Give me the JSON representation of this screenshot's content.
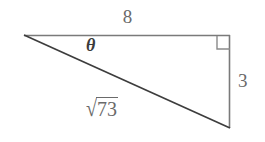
{
  "figure": {
    "type": "right-triangle-diagram",
    "background_color": "#ffffff",
    "width": 265,
    "height": 142,
    "labels": {
      "adjacent": "8",
      "opposite": "3",
      "hypotenuse_sign": "√",
      "hypotenuse_radicand": "73",
      "hypotenuse_full": "√73",
      "angle": "θ"
    },
    "colors": {
      "leg_stroke": "#7a7a7a",
      "hypotenuse_stroke": "#3d3d3d",
      "right_angle_stroke": "#8a8a8a",
      "label_gray": "#6a6a6a",
      "label_dark": "#3b3b3b"
    },
    "vertices": {
      "apex_left": [
        24,
        35
      ],
      "corner_top_right": [
        230,
        36
      ],
      "corner_bottom_right": [
        230,
        128
      ]
    },
    "right_angle_marker": {
      "x": 217,
      "y": 36,
      "size": 13
    }
  }
}
